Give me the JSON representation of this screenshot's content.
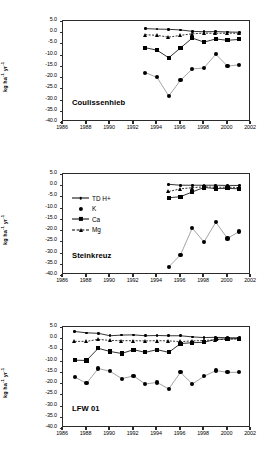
{
  "figure": {
    "width": 270,
    "height": 460,
    "background": "#ffffff",
    "line_color": "#000000",
    "axis_color": "#2b2b2b"
  },
  "axis": {
    "y_title_main": "kg ha",
    "y_title_sup1": "-1",
    "y_title_mid": " yr",
    "y_title_sup2": "-1",
    "y_ticks": [
      "5.0",
      "0.0",
      "-5.0",
      "-10.0",
      "-15.0",
      "-20.0",
      "-25.0",
      "-30.0",
      "-35.0",
      "-40.0"
    ],
    "y_tick_values": [
      5,
      0,
      -5,
      -10,
      -15,
      -20,
      -25,
      -30,
      -35,
      -40
    ],
    "y_min": -40,
    "y_max": 5,
    "x_ticks": [
      "1986",
      "1988",
      "1990",
      "1992",
      "1994",
      "1996",
      "1998",
      "2000",
      "2002"
    ],
    "x_tick_values": [
      1986,
      1988,
      1990,
      1992,
      1994,
      1996,
      1998,
      2000,
      2002
    ],
    "x_min": 1986,
    "x_max": 2002
  },
  "legend": {
    "panel": "Steinkreuz",
    "items": [
      {
        "label": "TD H+",
        "marker": "dot",
        "line": "solid"
      },
      {
        "label": "K",
        "marker": "circle",
        "line": "none"
      },
      {
        "label": "Ca",
        "marker": "square",
        "line": "solid"
      },
      {
        "label": "Mg",
        "marker": "triangle",
        "line": "dashed"
      }
    ]
  },
  "chart_data": [
    {
      "type": "line",
      "title": "Coulissenhieb",
      "xlabel": "",
      "ylabel": "kg ha-1 yr-1",
      "xlim": [
        1986,
        2002
      ],
      "ylim": [
        -40,
        5
      ],
      "grid": false,
      "legend_position": "none",
      "series": [
        {
          "name": "TD H+",
          "marker": "dot",
          "line": "solid",
          "x": [
            1993,
            1994,
            1995,
            1996,
            1997,
            1998,
            1999,
            2000,
            2001
          ],
          "values": [
            1.6,
            1.4,
            1.3,
            1.0,
            0.4,
            0.2,
            0.3,
            0.1,
            0.0
          ]
        },
        {
          "name": "K",
          "marker": "circle",
          "line": "solid",
          "x": [
            1993,
            1994,
            1995,
            1996,
            1997,
            1998,
            1999,
            2000,
            2001
          ],
          "values": [
            -18.0,
            -20.1,
            -28.4,
            -21.4,
            -16.4,
            -15.9,
            -9.8,
            -15.1,
            -14.5
          ]
        },
        {
          "name": "Ca",
          "marker": "square",
          "line": "solid",
          "x": [
            1993,
            1994,
            1995,
            1996,
            1997,
            1998,
            1999,
            2000,
            2001
          ],
          "values": [
            -6.9,
            -8.0,
            -11.4,
            -7.0,
            -2.6,
            -4.4,
            -3.0,
            -3.6,
            -3.2
          ]
        },
        {
          "name": "Mg",
          "marker": "triangle",
          "line": "dashed",
          "x": [
            1993,
            1994,
            1995,
            1996,
            1997,
            1998,
            1999,
            2000,
            2001
          ],
          "values": [
            -1.1,
            -1.4,
            -2.2,
            -1.4,
            -0.7,
            -0.4,
            -0.5,
            -0.4,
            -0.5
          ]
        }
      ]
    },
    {
      "type": "line",
      "title": "Steinkreuz",
      "xlabel": "",
      "ylabel": "kg ha-1 yr-1",
      "xlim": [
        1986,
        2002
      ],
      "ylim": [
        -40,
        5
      ],
      "grid": false,
      "legend_position": "upper-left",
      "series": [
        {
          "name": "TD H+",
          "marker": "dot",
          "line": "solid",
          "x": [
            1995,
            1996,
            1997,
            1998,
            1999,
            2000,
            2001
          ],
          "values": [
            0.4,
            0.0,
            0.0,
            0.0,
            0.0,
            -0.1,
            -0.1
          ]
        },
        {
          "name": "K",
          "marker": "circle",
          "line": "solid",
          "x": [
            1995,
            1996,
            1997,
            1998,
            1999,
            2000,
            2001
          ],
          "values": [
            -36.4,
            -31.0,
            -19.1,
            -25.3,
            -16.5,
            -23.7,
            -20.6
          ]
        },
        {
          "name": "Ca",
          "marker": "square",
          "line": "solid",
          "x": [
            1995,
            1996,
            1997,
            1998,
            1999,
            2000,
            2001
          ],
          "values": [
            -5.6,
            -5.1,
            -3.0,
            -1.0,
            -1.5,
            -1.4,
            -1.6
          ]
        },
        {
          "name": "Mg",
          "marker": "triangle",
          "line": "dashed",
          "x": [
            1995,
            1996,
            1997,
            1998,
            1999,
            2000,
            2001
          ],
          "values": [
            -2.8,
            -1.6,
            -1.1,
            -0.7,
            -0.9,
            -0.9,
            -1.0
          ]
        }
      ]
    },
    {
      "type": "line",
      "title": "LFW 01",
      "xlabel": "",
      "ylabel": "kg ha-1 yr-1",
      "xlim": [
        1986,
        2002
      ],
      "ylim": [
        -40,
        5
      ],
      "grid": false,
      "legend_position": "none",
      "series": [
        {
          "name": "TD H+",
          "marker": "dot",
          "line": "solid",
          "x": [
            1987,
            1988,
            1989,
            1990,
            1991,
            1992,
            1993,
            1994,
            1995,
            1996,
            1997,
            1998,
            1999,
            2000,
            2001
          ],
          "values": [
            3.0,
            2.4,
            2.2,
            1.1,
            1.4,
            1.5,
            1.1,
            1.2,
            1.1,
            1.1,
            0.6,
            0.3,
            0.4,
            0.2,
            0.2
          ]
        },
        {
          "name": "K",
          "marker": "circle",
          "line": "solid",
          "x": [
            1987,
            1988,
            1989,
            1990,
            1991,
            1992,
            1993,
            1994,
            1995,
            1996,
            1997,
            1998,
            1999,
            2000,
            2001
          ],
          "values": [
            -17.3,
            -20.1,
            -13.5,
            -14.7,
            -18.0,
            -16.8,
            -20.4,
            -19.7,
            -22.6,
            -15.2,
            -20.4,
            -17.0,
            -14.4,
            -15.2,
            -15.2
          ]
        },
        {
          "name": "Ca",
          "marker": "square",
          "line": "solid",
          "x": [
            1987,
            1988,
            1989,
            1990,
            1991,
            1992,
            1993,
            1994,
            1995,
            1996,
            1997,
            1998,
            1999,
            2000,
            2001
          ],
          "values": [
            -9.8,
            -9.9,
            -4.5,
            -5.9,
            -6.8,
            -5.1,
            -6.3,
            -5.1,
            -6.3,
            -2.4,
            -2.0,
            -1.8,
            -0.5,
            -0.3,
            -0.2
          ]
        },
        {
          "name": "Mg",
          "marker": "triangle",
          "line": "dashed",
          "x": [
            1987,
            1988,
            1989,
            1990,
            1991,
            1992,
            1993,
            1994,
            1995,
            1996,
            1997,
            1998,
            1999,
            2000,
            2001
          ],
          "values": [
            -1.4,
            -1.4,
            -0.5,
            -1.0,
            -1.1,
            -1.1,
            -1.2,
            -1.1,
            -1.2,
            -1.5,
            -1.2,
            -1.0,
            -0.7,
            -0.4,
            -0.3
          ]
        }
      ]
    }
  ]
}
